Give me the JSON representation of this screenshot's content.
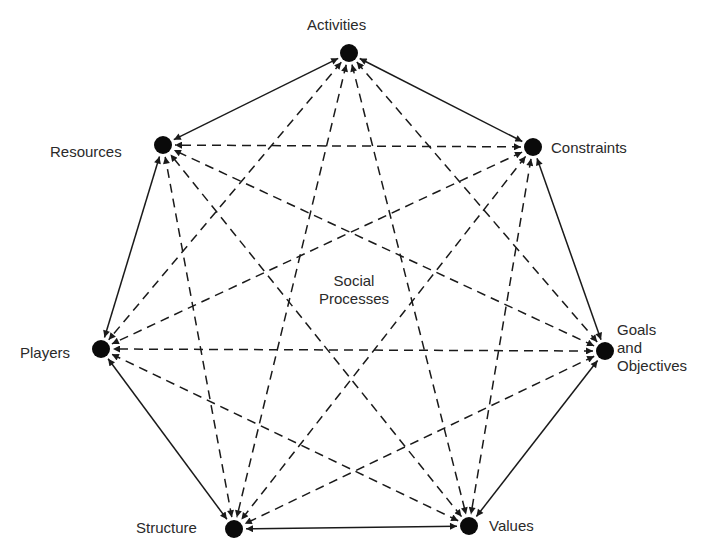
{
  "diagram": {
    "title": "Social Processes",
    "center_label": [
      "Social",
      "Processes"
    ],
    "nodes": [
      {
        "id": "activities",
        "label": "Activities",
        "x": 349,
        "y": 53
      },
      {
        "id": "constraints",
        "label": "Constraints",
        "x": 533,
        "y": 147
      },
      {
        "id": "goals",
        "label": [
          "Goals",
          "and",
          "Objectives"
        ],
        "x": 605,
        "y": 351
      },
      {
        "id": "values",
        "label": "Values",
        "x": 469,
        "y": 526
      },
      {
        "id": "structure",
        "label": "Structure",
        "x": 234,
        "y": 529
      },
      {
        "id": "players",
        "label": "Players",
        "x": 101,
        "y": 349
      },
      {
        "id": "resources",
        "label": "Resources",
        "x": 163,
        "y": 145
      }
    ],
    "edge_styles": {
      "perimeter": "solid, bidirectional arrows",
      "internal": "dashed, bidirectional arrows"
    },
    "colors": {
      "node": "#0a0a0a",
      "line": "#1a1a1a",
      "text": "#2a2a2a",
      "background": "#ffffff"
    }
  }
}
